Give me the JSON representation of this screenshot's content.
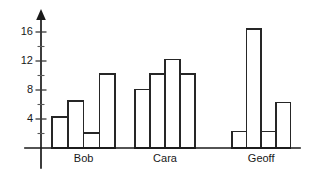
{
  "chart_data": {
    "type": "bar",
    "title": "",
    "subtitle": "",
    "xlabel": "",
    "ylabel": "",
    "categories": [
      "Bob",
      "Cara",
      "Geoff"
    ],
    "series": [
      {
        "name": "Bar 1",
        "values": [
          4.3,
          8.1,
          2.3
        ]
      },
      {
        "name": "Bar 2",
        "values": [
          6.5,
          10.2,
          16.4
        ]
      },
      {
        "name": "Bar 3",
        "values": [
          2.1,
          12.2,
          2.3
        ]
      },
      {
        "name": "Bar 4",
        "values": [
          10.2,
          10.2,
          6.3
        ]
      }
    ],
    "groups": [
      {
        "label": "Bob",
        "values": [
          4.3,
          6.5,
          2.1,
          10.2
        ]
      },
      {
        "label": "Cara",
        "values": [
          8.1,
          10.2,
          12.2,
          10.2
        ]
      },
      {
        "label": "Geoff",
        "values": [
          2.3,
          16.4,
          2.3,
          6.3
        ]
      }
    ],
    "ylim": [
      0,
      18
    ],
    "xlim": [
      0,
      1
    ],
    "y_major_ticks": [
      4,
      8,
      12,
      16
    ],
    "y_minor_ticks": [
      2,
      6,
      10,
      14
    ],
    "y_tick_labels": [
      "4",
      "8",
      "12",
      "16"
    ],
    "grid": false,
    "legend": false,
    "legend_position": "none",
    "bar_fill": "#ffffff",
    "bar_stroke": "#262626",
    "axis_color": "#1a1a1a",
    "y_axis_arrow": true,
    "annotations": []
  },
  "axis": {
    "y_label_0": "4",
    "y_label_1": "8",
    "y_label_2": "12",
    "y_label_3": "16"
  },
  "labels": {
    "group_0": "Bob",
    "group_1": "Cara",
    "group_2": "Geoff"
  }
}
